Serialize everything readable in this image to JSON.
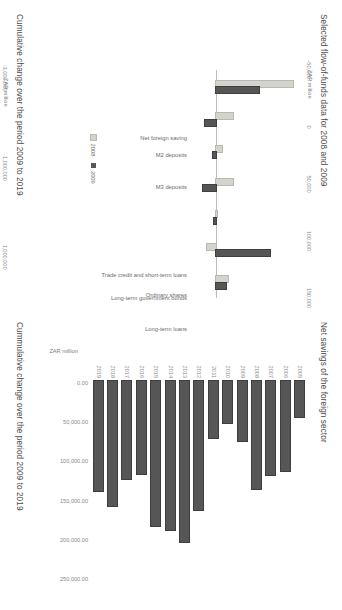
{
  "page": {
    "background": "#ffffff",
    "orientation_deg": 90
  },
  "palette": {
    "series_2008": "#d4d4ce",
    "series_2009": "#565656",
    "bar_dark": "#565656",
    "bar_light": "#d4d4ce",
    "text": "#595959",
    "tick_text": "#8a8a8a"
  },
  "chart_data": [
    {
      "id": "flow-of-funds-2008-2009",
      "type": "bar",
      "orientation": "vertical",
      "title": "Selected flow-of-funds data for 2008 and 2009",
      "ylabel": "ZAR million",
      "xlabel": "",
      "ylim": [
        -50000,
        150000
      ],
      "yticks": [
        "-50,000",
        "0",
        "50,000",
        "100,000",
        "150,000"
      ],
      "ytick_values": [
        -50000,
        0,
        50000,
        100000,
        150000
      ],
      "grid": false,
      "legend_position": "bottom",
      "categories": [
        "Net foreign saving",
        "M2 deposits",
        "M3 deposits",
        "Trade credit and short-term loans",
        "Long-term government bonds",
        "Ordinary shares",
        "Long-term loans"
      ],
      "series": [
        {
          "name": "2008",
          "color": "#d4d4ce",
          "values": [
            138000,
            31000,
            11000,
            30000,
            2000,
            -16000,
            22000
          ]
        },
        {
          "name": "2009",
          "color": "#565656",
          "values": [
            77000,
            -20000,
            -6000,
            -23000,
            -3000,
            96000,
            18000
          ]
        }
      ]
    },
    {
      "id": "cumulative-change-2009-2019-instruments",
      "type": "bar",
      "orientation": "vertical",
      "title": "Cumulative change over the period 2009 to 2019",
      "ylabel": "ZAR million",
      "xlabel": "",
      "ylim": [
        -3000000,
        1600000
      ],
      "yticks": [
        "-3,000,000",
        "-1,000,000",
        "1,000,000"
      ],
      "ytick_values": [
        -3000000,
        -1000000,
        1000000
      ],
      "grid": false,
      "legend_position": "none",
      "categories": [
        "M2 deposits",
        "Trade credit & short-term loans",
        "Long term gov bonds",
        "Shares",
        "Long term loans",
        "Financial derivatives"
      ],
      "series": [
        {
          "name": "Cumulative change",
          "color": "#565656",
          "values": [
            120000,
            520000,
            1080000,
            1200000,
            820000,
            -2600000
          ]
        }
      ]
    },
    {
      "id": "net-savings-foreign-sector",
      "type": "bar",
      "orientation": "horizontal",
      "title": "Net savings of the foreign sector",
      "ylabel": "ZAR million",
      "xlabel": "",
      "xlim": [
        0,
        250000
      ],
      "xticks": [
        "0.00",
        "50,000.00",
        "100,000.00",
        "150,000.00",
        "200,000.00",
        "250,000.00"
      ],
      "xtick_values": [
        0,
        50000,
        100000,
        150000,
        200000,
        250000
      ],
      "grid": false,
      "legend_position": "none",
      "categories": [
        "2005",
        "2006",
        "2007",
        "2008",
        "2009",
        "2010",
        "2011",
        "2012",
        "2013",
        "2014",
        "2015",
        "2016",
        "2017",
        "2018",
        "2019"
      ],
      "series": [
        {
          "name": "Net savings",
          "color": "#565656",
          "values": [
            46000,
            115000,
            120000,
            138000,
            77000,
            53000,
            73000,
            165000,
            205000,
            190000,
            185000,
            118000,
            125000,
            160000,
            140000
          ]
        }
      ]
    },
    {
      "id": "cumulative-change-2009-2019-aggregates",
      "type": "bar",
      "orientation": "horizontal",
      "title": "Cummulative change over the period 2009 to 2019",
      "ylabel": "ZAR million",
      "xlabel": "",
      "xlim": [
        -2000000,
        2000000
      ],
      "xticks": [
        "-2,000,000",
        "-1,000,000",
        "0",
        "1,000,000",
        "2,000,000"
      ],
      "xtick_values": [
        -2000000,
        -1000000,
        0,
        1000000,
        2000000
      ],
      "grid": false,
      "legend_position": "none",
      "categories": [
        "Net savings",
        "Net financial liabilities",
        "Net financial assets"
      ],
      "series": [
        {
          "name": "Cumulative change",
          "values": [
            1550000,
            -1380000,
            330000
          ],
          "colors": [
            "#d4d4ce",
            "#565656",
            "#565656"
          ]
        }
      ]
    }
  ]
}
